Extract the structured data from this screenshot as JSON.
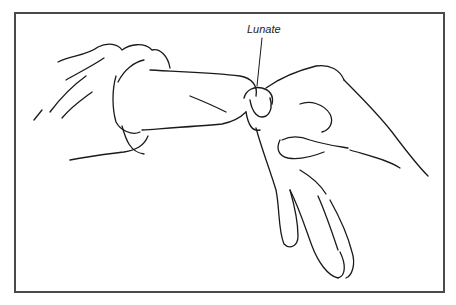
{
  "figure": {
    "type": "line-art medical illustration",
    "annotation": {
      "label": "Lunate",
      "leader_line": true
    },
    "frame": {
      "border_color": "#4a4a4a",
      "background": "#ffffff"
    }
  }
}
